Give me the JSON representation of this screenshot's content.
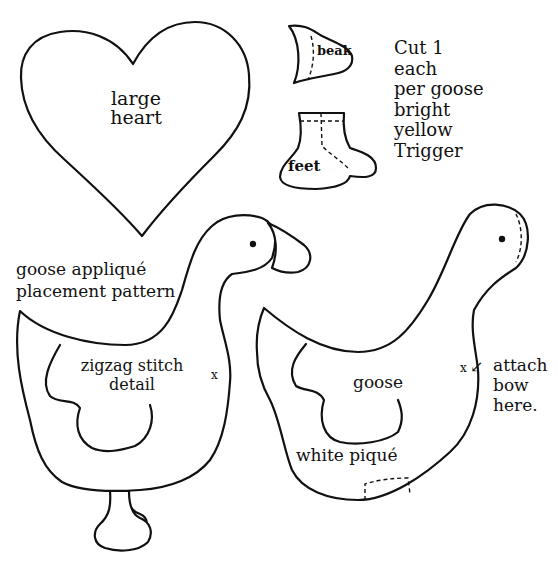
{
  "pattern": {
    "heart": {
      "label_line1": "large",
      "label_line2": "heart"
    },
    "beak": {
      "label": "beak"
    },
    "feet": {
      "label": "feet"
    },
    "instructions": [
      "Cut 1",
      "each",
      "per goose",
      "bright",
      "yellow",
      "Trigger"
    ],
    "left_goose": {
      "title_line1": "goose appliqué",
      "title_line2": "placement pattern",
      "wing_line1": "zigzag stitch",
      "wing_line2": "detail",
      "mark": "x"
    },
    "right_goose": {
      "wing_label": "goose",
      "fabric_label": "white piqué",
      "mark": "x",
      "arrow": "↙",
      "note_line1": "attach",
      "note_line2": "bow",
      "note_line3": "here."
    },
    "colors": {
      "line": "#111111",
      "background": "#ffffff"
    }
  }
}
